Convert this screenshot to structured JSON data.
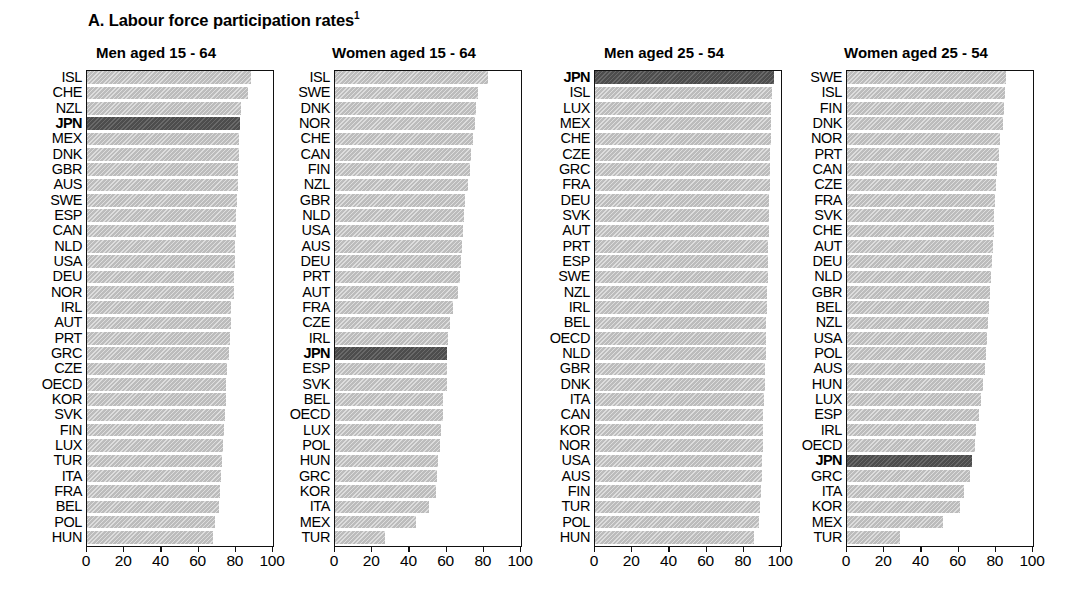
{
  "figure": {
    "title": "A. Labour force participation rates",
    "title_footnote": "1",
    "highlight_country": "JPN",
    "colors": {
      "bar": "#bcbcbc",
      "highlight_bar": "#4d4d4d",
      "axis": "#111111",
      "background": "#ffffff"
    }
  },
  "chart_data": [
    {
      "type": "bar",
      "orientation": "horizontal",
      "title": "Men aged 15 - 64",
      "xlabel": "",
      "ylabel": "",
      "xlim": [
        0,
        100
      ],
      "ticks": [
        0,
        20,
        40,
        60,
        80,
        100
      ],
      "tick_labels": [
        "0",
        "20",
        "40",
        "60",
        "80",
        "100"
      ],
      "grid": false,
      "legend": "none",
      "highlight": "JPN",
      "categories": [
        "ISL",
        "CHE",
        "NZL",
        "JPN",
        "MEX",
        "DNK",
        "GBR",
        "AUS",
        "SWE",
        "ESP",
        "CAN",
        "NLD",
        "USA",
        "DEU",
        "NOR",
        "IRL",
        "AUT",
        "PRT",
        "GRC",
        "CZE",
        "OECD",
        "KOR",
        "SVK",
        "FIN",
        "LUX",
        "TUR",
        "ITA",
        "FRA",
        "BEL",
        "POL",
        "HUN"
      ],
      "values": [
        88.5,
        87.0,
        83.5,
        83.0,
        82.5,
        82.0,
        81.8,
        81.5,
        81.0,
        80.8,
        80.5,
        80.3,
        80.0,
        79.8,
        79.5,
        78.0,
        77.8,
        77.5,
        77.0,
        76.0,
        75.5,
        75.0,
        74.5,
        74.0,
        73.5,
        73.0,
        72.5,
        72.0,
        71.5,
        69.5,
        68.5
      ]
    },
    {
      "type": "bar",
      "orientation": "horizontal",
      "title": "Women aged 15 - 64",
      "xlabel": "",
      "ylabel": "",
      "xlim": [
        0,
        100
      ],
      "ticks": [
        0,
        20,
        40,
        60,
        80,
        100
      ],
      "tick_labels": [
        "0",
        "20",
        "40",
        "60",
        "80",
        "100"
      ],
      "grid": false,
      "legend": "none",
      "highlight": "JPN",
      "categories": [
        "ISL",
        "SWE",
        "DNK",
        "NOR",
        "CHE",
        "CAN",
        "FIN",
        "NZL",
        "GBR",
        "NLD",
        "USA",
        "AUS",
        "DEU",
        "PRT",
        "AUT",
        "FRA",
        "CZE",
        "IRL",
        "JPN",
        "ESP",
        "SVK",
        "BEL",
        "OECD",
        "LUX",
        "POL",
        "HUN",
        "GRC",
        "KOR",
        "ITA",
        "MEX",
        "TUR"
      ],
      "values": [
        83.0,
        77.5,
        76.5,
        76.0,
        74.5,
        73.5,
        73.0,
        72.0,
        70.5,
        70.0,
        69.5,
        69.0,
        68.5,
        68.0,
        66.5,
        64.0,
        62.5,
        61.5,
        61.0,
        60.5,
        60.5,
        58.5,
        58.5,
        57.5,
        57.0,
        56.0,
        55.5,
        55.0,
        51.0,
        44.0,
        27.5
      ]
    },
    {
      "type": "bar",
      "orientation": "horizontal",
      "title": "Men aged 25 - 54",
      "xlabel": "",
      "ylabel": "",
      "xlim": [
        0,
        100
      ],
      "ticks": [
        0,
        20,
        40,
        60,
        80,
        100
      ],
      "tick_labels": [
        "0",
        "20",
        "40",
        "60",
        "80",
        "100"
      ],
      "grid": false,
      "legend": "none",
      "highlight": "JPN",
      "categories": [
        "JPN",
        "ISL",
        "LUX",
        "MEX",
        "CHE",
        "CZE",
        "GRC",
        "FRA",
        "DEU",
        "SVK",
        "AUT",
        "PRT",
        "ESP",
        "SWE",
        "NZL",
        "IRL",
        "BEL",
        "OECD",
        "NLD",
        "GBR",
        "DNK",
        "ITA",
        "CAN",
        "KOR",
        "NOR",
        "USA",
        "AUS",
        "FIN",
        "TUR",
        "POL",
        "HUN"
      ],
      "values": [
        97.0,
        95.5,
        95.0,
        95.0,
        95.0,
        94.5,
        94.5,
        94.5,
        94.0,
        94.0,
        94.0,
        93.8,
        93.5,
        93.5,
        93.0,
        92.8,
        92.5,
        92.5,
        92.3,
        92.0,
        92.0,
        91.5,
        91.0,
        91.0,
        90.8,
        90.5,
        90.3,
        90.0,
        89.5,
        88.5,
        86.0
      ]
    },
    {
      "type": "bar",
      "orientation": "horizontal",
      "title": "Women aged 25 - 54",
      "xlabel": "",
      "ylabel": "",
      "xlim": [
        0,
        100
      ],
      "ticks": [
        0,
        20,
        40,
        60,
        80,
        100
      ],
      "tick_labels": [
        "0",
        "20",
        "40",
        "60",
        "80",
        "100"
      ],
      "grid": false,
      "legend": "none",
      "highlight": "JPN",
      "categories": [
        "SWE",
        "ISL",
        "FIN",
        "DNK",
        "NOR",
        "PRT",
        "CAN",
        "CZE",
        "FRA",
        "SVK",
        "CHE",
        "AUT",
        "DEU",
        "NLD",
        "GBR",
        "BEL",
        "NZL",
        "USA",
        "POL",
        "AUS",
        "HUN",
        "LUX",
        "ESP",
        "IRL",
        "OECD",
        "JPN",
        "GRC",
        "ITA",
        "KOR",
        "MEX",
        "TUR"
      ],
      "values": [
        86.0,
        85.5,
        85.0,
        84.5,
        83.0,
        82.0,
        81.0,
        80.5,
        80.0,
        79.5,
        79.5,
        79.0,
        78.5,
        78.0,
        77.5,
        77.0,
        76.5,
        76.0,
        75.5,
        74.5,
        73.5,
        72.5,
        71.5,
        70.0,
        69.5,
        68.0,
        66.5,
        63.5,
        61.5,
        52.0,
        29.0
      ]
    }
  ],
  "panels_layout": [
    {
      "left": 40,
      "width": 232
    },
    {
      "left": 288,
      "width": 232
    },
    {
      "left": 548,
      "width": 232
    },
    {
      "left": 800,
      "width": 232
    }
  ]
}
